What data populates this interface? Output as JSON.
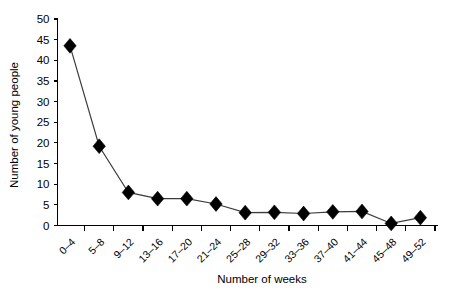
{
  "chart_data": {
    "type": "line",
    "title": "",
    "xlabel": "Number of weeks",
    "ylabel": "Number of young people",
    "categories": [
      "0–4",
      "5–8",
      "9–12",
      "13–16",
      "17–20",
      "21–24",
      "25–28",
      "29–32",
      "33–36",
      "37–40",
      "41–44",
      "45–48",
      "49–52"
    ],
    "values": [
      43.5,
      19.2,
      8.0,
      6.5,
      6.5,
      5.2,
      3.1,
      3.2,
      2.9,
      3.3,
      3.4,
      0.5,
      1.9
    ],
    "ylim": [
      0,
      50
    ],
    "yticks": [
      0,
      5,
      10,
      15,
      20,
      25,
      30,
      35,
      40,
      45,
      50
    ],
    "ytick_labels": [
      "0",
      "5",
      "10",
      "15",
      "20",
      "25",
      "30",
      "35",
      "40",
      "45",
      "50"
    ],
    "grid": false,
    "legend": false,
    "legend_position": "none",
    "marker": "diamond",
    "marker_color": "#000000",
    "line_color": "#3c3c3c",
    "background_color": "#ffffff",
    "xtick_label_rotation": -45
  }
}
